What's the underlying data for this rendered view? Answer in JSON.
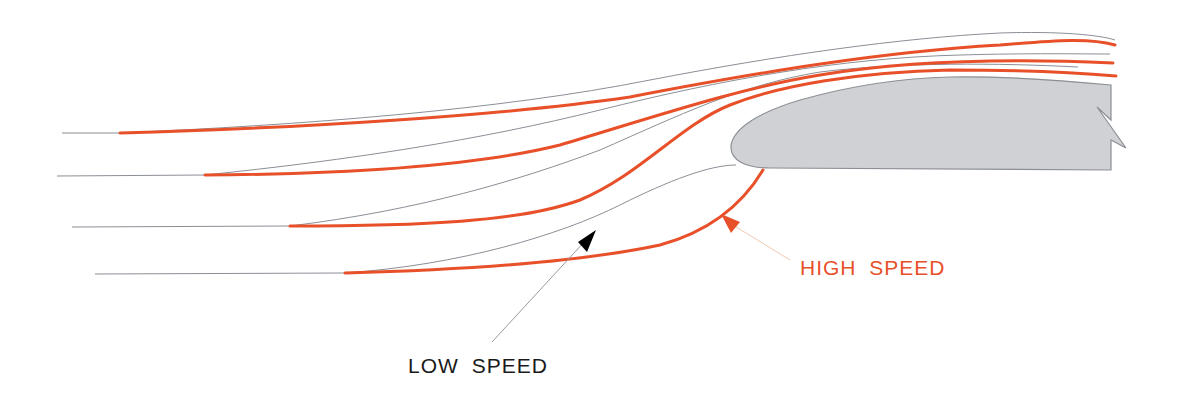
{
  "diagram": {
    "labels": {
      "high_speed": "HIGH  SPEED",
      "low_speed": "LOW  SPEED"
    },
    "colors": {
      "fast_flow": "#e8502a",
      "slow_flow": "#8a8f96",
      "airfoil_fill": "#cfd1d4",
      "airfoil_stroke": "#8c9096",
      "high_speed_text": "#e8502a",
      "low_speed_text": "#1a1a1a",
      "high_arrow_line": "#f0c8b0",
      "low_arrow_line": "#9a9a9a"
    },
    "streamlines": {
      "thin_count": 4,
      "thick_count": 4
    },
    "legend": [
      {
        "key": "high_speed",
        "meaning": "thick orange streamlines"
      },
      {
        "key": "low_speed",
        "meaning": "thin gray streamlines"
      }
    ]
  }
}
